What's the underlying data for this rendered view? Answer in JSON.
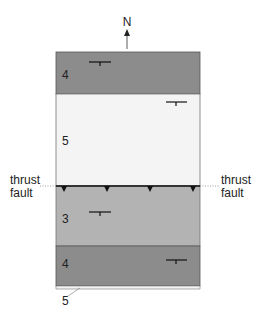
{
  "north": {
    "label": "N"
  },
  "units": [
    {
      "id": "unit-4-top",
      "label": "4",
      "color": "#8c8c8c"
    },
    {
      "id": "unit-5-upper",
      "label": "5",
      "color": "#f4f4f4"
    },
    {
      "id": "unit-3",
      "label": "3",
      "color": "#b3b3b3"
    },
    {
      "id": "unit-4-bottom",
      "label": "4",
      "color": "#8c8c8c"
    },
    {
      "id": "unit-5-thin",
      "label": "5",
      "color": "#f4f4f4"
    }
  ],
  "fault": {
    "left_label_line1": "thrust",
    "left_label_line2": "fault",
    "right_label_line1": "thrust",
    "right_label_line2": "fault"
  }
}
